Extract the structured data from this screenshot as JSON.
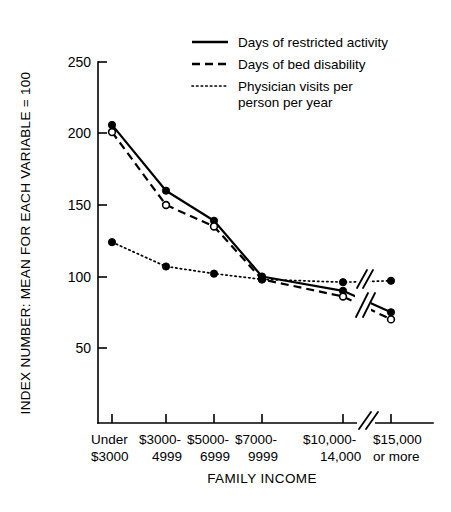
{
  "chart_data": {
    "type": "line",
    "title": "",
    "xlabel": "FAMILY INCOME",
    "ylabel": "INDEX NUMBER: MEAN FOR EACH VARIABLE = 100",
    "categories": [
      "Under $3000",
      "$3000-4999",
      "$5000-6999",
      "$7000-9999",
      "$10,000-14,000",
      "$15,000 or more"
    ],
    "category_lines": [
      [
        "Under",
        "$3000"
      ],
      [
        "$3000-",
        "4999"
      ],
      [
        "$5000-",
        "6999"
      ],
      [
        "$7000-",
        "9999"
      ],
      [
        "$10,000-",
        "14,000"
      ],
      [
        "$15,000",
        "or more"
      ]
    ],
    "ylim": [
      0,
      250
    ],
    "yticks": [
      50,
      100,
      150,
      200,
      250
    ],
    "ytick_labels": [
      "50",
      "100",
      "150",
      "200",
      "250"
    ],
    "grid": false,
    "legend_position": "top-right",
    "x_axis_break": true,
    "x_axis_break_between": [
      "$10,000-14,000",
      "$15,000 or more"
    ],
    "series": [
      {
        "name": "Days of restricted activity",
        "style": "solid",
        "marker": "filled-circle",
        "values": [
          206,
          160,
          139,
          100,
          90,
          75
        ]
      },
      {
        "name": "Days of bed disability",
        "style": "dashed",
        "marker": "open-circle",
        "values": [
          201,
          150,
          135,
          98,
          86,
          70
        ]
      },
      {
        "name": "Physician visits per person per year",
        "style": "dotted",
        "marker": "filled-circle",
        "values": [
          124,
          107,
          102,
          98,
          96,
          97
        ]
      }
    ]
  },
  "legend": {
    "items": [
      {
        "label": "Days of restricted activity",
        "label_line2": "",
        "style": "solid"
      },
      {
        "label": "Days of bed disability",
        "label_line2": "",
        "style": "dashed"
      },
      {
        "label": "Physician visits per",
        "label_line2": "person per year",
        "style": "dotted"
      }
    ]
  },
  "axes": {
    "y_title": "INDEX NUMBER: MEAN FOR EACH VARIABLE = 100",
    "x_title": "FAMILY INCOME",
    "ytick_0": "250",
    "ytick_1": "200",
    "ytick_2": "150",
    "ytick_3": "100",
    "ytick_4": "50"
  },
  "xlabels": {
    "c0_l1": "Under",
    "c0_l2": "$3000",
    "c1_l1": "$3000-",
    "c1_l2": "4999",
    "c2_l1": "$5000-",
    "c2_l2": "6999",
    "c3_l1": "$7000-",
    "c3_l2": "9999",
    "c4_l1": "$10,000-",
    "c4_l2": "14,000",
    "c5_l1": "$15,000",
    "c5_l2": "or more"
  },
  "colors": {
    "background": "#ffffff",
    "ink": "#000000"
  }
}
